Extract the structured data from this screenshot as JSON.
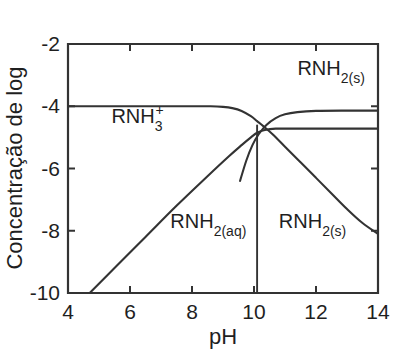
{
  "chart_data": {
    "type": "line",
    "title": "",
    "xlabel": "pH",
    "ylabel": "Concentração de log",
    "xlim": [
      4,
      14
    ],
    "ylim": [
      -10,
      -2
    ],
    "xticks": [
      4,
      6,
      8,
      10,
      12,
      14
    ],
    "xtick_labels": [
      "4",
      "6",
      "8",
      "10",
      "12",
      "14"
    ],
    "yticks": [
      -2,
      -4,
      -6,
      -8,
      -10
    ],
    "ytick_labels": [
      "-2",
      "-4",
      "-6",
      "-8",
      "-10"
    ],
    "grid": false,
    "legend": "none (inline curve annotations)",
    "annotations": [
      {
        "id": "rnh3-plus",
        "text": "RNH3+",
        "base": "RNH",
        "sub": "3",
        "sup": "+",
        "x": 5.4,
        "y": -4.55
      },
      {
        "id": "rnh2-s-top",
        "text": "RNH2(s)",
        "base": "RNH",
        "sub": "2(s)",
        "sup": "",
        "x": 11.4,
        "y": -3.0
      },
      {
        "id": "rnh2-aq",
        "text": "RNH2(aq)",
        "base": "RNH",
        "sub": "2(aq)",
        "sup": "",
        "x": 7.3,
        "y": -7.9
      },
      {
        "id": "rnh2-s-mid",
        "text": "RNH2(s)",
        "base": "RNH",
        "sub": "2(s)",
        "sup": "",
        "x": 10.8,
        "y": -7.9
      }
    ],
    "series": [
      {
        "name": "RNH3+",
        "comment": "protonated amine: plateau at log C = -4 then steep decline after pH ~9.8",
        "points": [
          [
            4.0,
            -4.0
          ],
          [
            5.0,
            -4.0
          ],
          [
            6.0,
            -4.0
          ],
          [
            7.0,
            -4.0
          ],
          [
            8.0,
            -4.0
          ],
          [
            8.6,
            -4.0
          ],
          [
            9.0,
            -4.02
          ],
          [
            9.3,
            -4.06
          ],
          [
            9.6,
            -4.15
          ],
          [
            9.9,
            -4.32
          ],
          [
            10.1,
            -4.48
          ],
          [
            10.3,
            -4.64
          ],
          [
            10.6,
            -4.9
          ],
          [
            11.0,
            -5.3
          ],
          [
            11.5,
            -5.8
          ],
          [
            12.0,
            -6.3
          ],
          [
            12.5,
            -6.8
          ],
          [
            13.0,
            -7.3
          ],
          [
            13.5,
            -7.75
          ],
          [
            14.0,
            -8.1
          ]
        ]
      },
      {
        "name": "RNH2(aq)",
        "comment": "dissolved free amine: linear rise from -10 at pH 4.7, saturating at the solubility plateau -4.72",
        "points": [
          [
            4.7,
            -10.0
          ],
          [
            5.5,
            -9.2
          ],
          [
            6.5,
            -8.2
          ],
          [
            7.5,
            -7.2
          ],
          [
            8.5,
            -6.25
          ],
          [
            9.2,
            -5.6
          ],
          [
            9.6,
            -5.25
          ],
          [
            9.9,
            -5.0
          ],
          [
            10.1,
            -4.85
          ],
          [
            10.35,
            -4.76
          ],
          [
            10.7,
            -4.72
          ],
          [
            11.5,
            -4.72
          ],
          [
            12.5,
            -4.72
          ],
          [
            14.0,
            -4.72
          ]
        ]
      },
      {
        "name": "RNH2(s)",
        "comment": "solid amine: rises through the crossing region to a plateau at -4.15",
        "points": [
          [
            9.55,
            -6.4
          ],
          [
            9.75,
            -5.75
          ],
          [
            9.95,
            -5.25
          ],
          [
            10.15,
            -4.9
          ],
          [
            10.4,
            -4.6
          ],
          [
            10.7,
            -4.38
          ],
          [
            11.0,
            -4.26
          ],
          [
            11.4,
            -4.19
          ],
          [
            12.0,
            -4.15
          ],
          [
            13.0,
            -4.14
          ],
          [
            14.0,
            -4.14
          ]
        ]
      },
      {
        "name": "phase-boundary",
        "comment": "vertical drop line marking onset of precipitation at pH 10.1",
        "points": [
          [
            10.1,
            -4.62
          ],
          [
            10.1,
            -10.0
          ]
        ]
      }
    ]
  },
  "figure": {
    "background_color": "#ffffff",
    "line_color": "#333333",
    "axis_color": "#333333",
    "text_color": "#1f1f1f"
  }
}
